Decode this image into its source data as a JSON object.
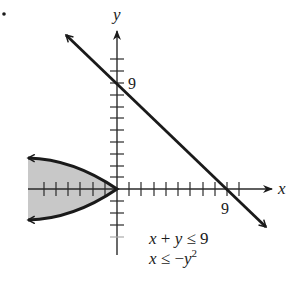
{
  "problem_marker": ".",
  "axes": {
    "x_label": "x",
    "y_label": "y",
    "x_tick_label": "9",
    "y_tick_label": "9",
    "x_range": [
      -7.3,
      12.5
    ],
    "y_range": [
      -5.6,
      13
    ],
    "tick_step": 1
  },
  "graph": {
    "line_equation": "x + y = 9",
    "curve_equation": "x = -y^2",
    "shaded_region": "x ≤ -y² and x + y ≤ 9",
    "shade_color": "#c8c8c8",
    "stroke_color": "#1a1a1a"
  },
  "legend": {
    "line1_a": "x",
    "line1_op": " + ",
    "line1_b": "y",
    "line1_rel": " ≤ 9",
    "line2_a": "x",
    "line2_rel": " ≤ −",
    "line2_b": "y",
    "line2_exp": "2"
  }
}
